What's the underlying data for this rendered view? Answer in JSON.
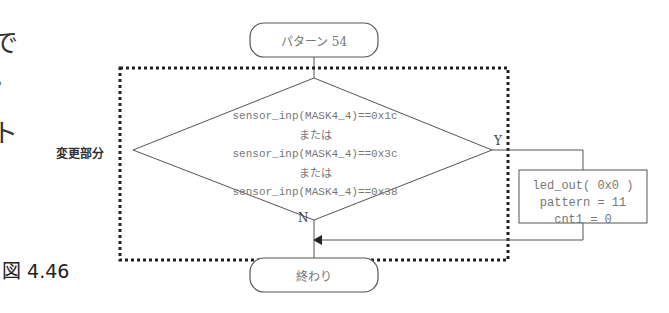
{
  "page": {
    "clipped_left_chars": [
      "で",
      "。",
      "ト"
    ],
    "figure_label": "図 4.46",
    "side_label": "変更部分"
  },
  "flowchart": {
    "start": {
      "label": "パターン 54",
      "shape": "terminal"
    },
    "changed_region": {
      "style": "dotted-border",
      "label_ref": "変更部分"
    },
    "decision": {
      "shape": "diamond",
      "lines": [
        "sensor_inp(MASK4_4)==0x1c",
        "または",
        "sensor_inp(MASK4_4)==0x3c",
        "または",
        "sensor_inp(MASK4_4)==0x38"
      ],
      "yes_label": "Y",
      "no_label": "N"
    },
    "process": {
      "shape": "rectangle",
      "lines": [
        "led_out( 0x0 )",
        "pattern = 11",
        "cnt1 = 0"
      ]
    },
    "end": {
      "label": "終わり",
      "shape": "terminal"
    }
  },
  "colors": {
    "line": "#555555",
    "dotted_border": "#222222",
    "text": "#777777"
  }
}
